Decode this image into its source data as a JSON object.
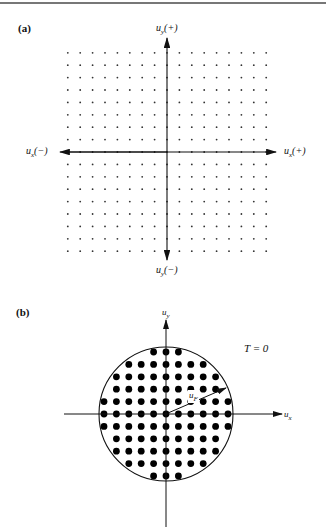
{
  "figure": {
    "panel_a": {
      "label": "(a)",
      "axis_labels": {
        "uy_plus": "u",
        "uy_plus_sub": "y",
        "uy_plus_suffix": "(+)",
        "uy_minus": "u",
        "uy_minus_sub": "y",
        "uy_minus_suffix": "(−)",
        "ux_plus": "u",
        "ux_plus_sub": "x",
        "ux_plus_suffix": "(+)",
        "ux_minus": "u",
        "ux_minus_sub": "x",
        "ux_minus_suffix": "(−)"
      },
      "grid": {
        "half_count": 8,
        "spacing_px": 12.4,
        "dot_radius": 0.9,
        "dot_color": "#333333"
      }
    },
    "panel_b": {
      "label": "(b)",
      "axis_labels": {
        "uy": "u",
        "uy_sub": "y",
        "ux": "u",
        "ux_sub": "x",
        "radius": "u",
        "radius_sub": "F"
      },
      "annotation": "T = 0",
      "circle": {
        "radius_px": 67,
        "grid_half_count": 5,
        "spacing_px": 12.4,
        "dot_radius": 3.4,
        "dot_color": "#000000"
      }
    }
  }
}
